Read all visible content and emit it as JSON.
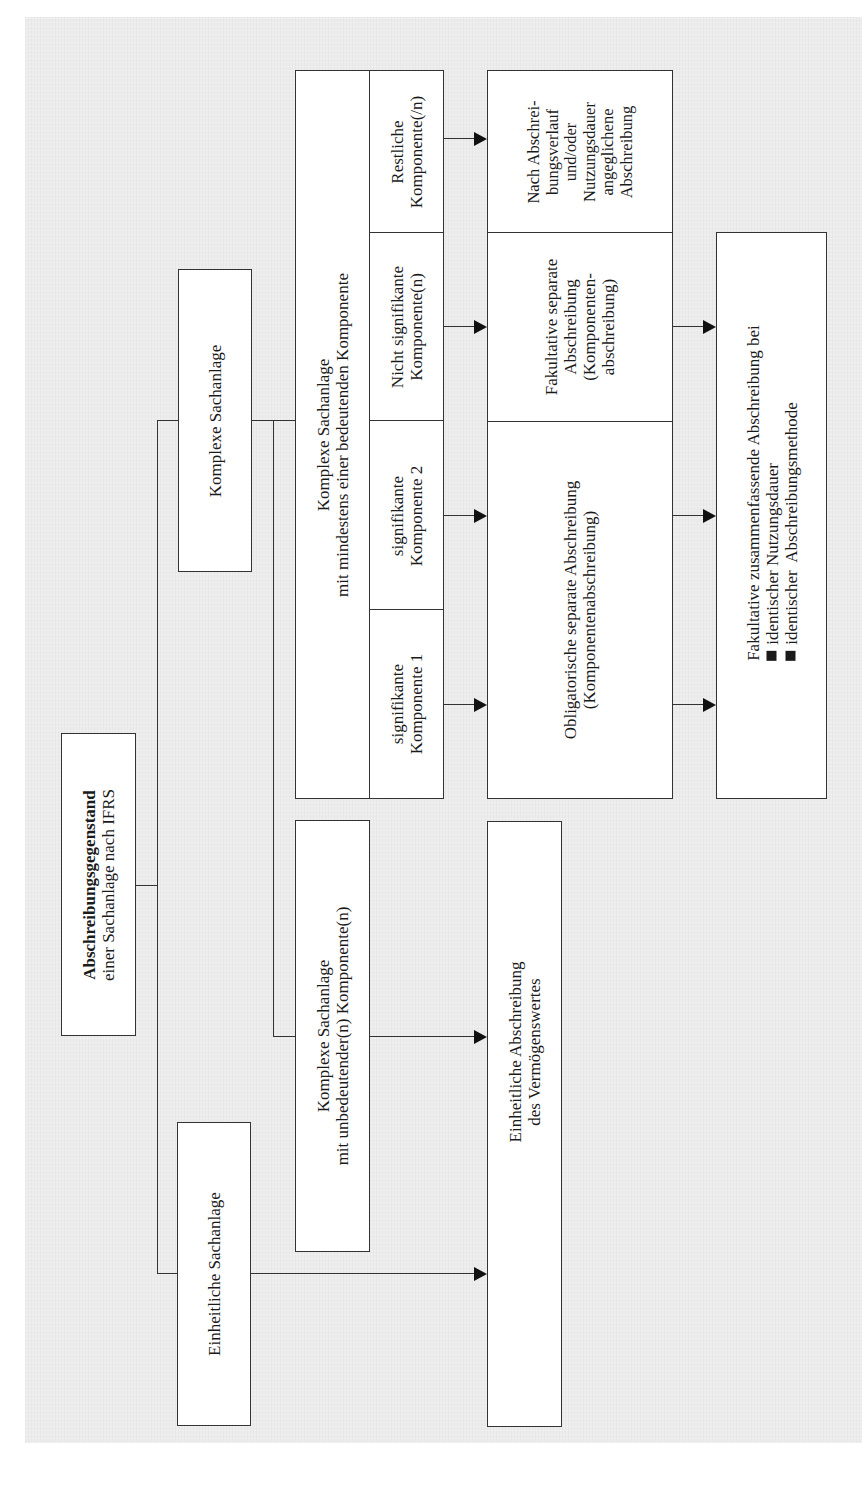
{
  "diagram": {
    "orientation": "rotated-90-ccw",
    "root": {
      "title_bold": "Abschreibungsgegenstand",
      "subtitle": "einer Sachanlage nach IFRS"
    },
    "categories": {
      "einheitliche": {
        "label": "Einheitliche Sachanlage"
      },
      "komplexe": {
        "label": "Komplexe Sachanlage"
      }
    },
    "komplexe_unbedeutend": {
      "line1": "Komplexe Sachanlage",
      "line2": "mit unbedeutender(n) Komponente(n)"
    },
    "komplexe_bedeutend": {
      "line1": "Komplexe Sachanlage",
      "line2": "mit mindestens einer bedeutenden Komponente",
      "components": [
        {
          "line1": "signifikante",
          "line2": "Komponente 1"
        },
        {
          "line1": "signifikante",
          "line2": "Komponente 2"
        },
        {
          "line1": "Nicht signifikante",
          "line2": "Komponente(n)"
        },
        {
          "line1": "Restliche",
          "line2": "Komponente(/n)"
        }
      ]
    },
    "treatments": {
      "einheitlich": {
        "line1": "Einheitliche Abschreibung",
        "line2": "des Vermögenswertes"
      },
      "obligatorisch": {
        "line1": "Obligatorische separate Abschreibung",
        "line2": "(Komponentenabschreibung)"
      },
      "fakultativ_separat": {
        "line1": "Fakultative separate",
        "line2": "Abschreibung",
        "line3": "(Komponenten-",
        "line4": "abschreibung)"
      },
      "angeglichen": {
        "line1": "Nach Abschrei-",
        "line2": "bungsverlauf",
        "line3": "und/oder",
        "line4": "Nutzungsdauer",
        "line5": "angeglichene",
        "line6": "Abschreibung"
      }
    },
    "zusammenfassend": {
      "heading": "Fakultative zusammenfassende Abschreibung bei",
      "bullets": [
        "identischer Nutzungsdauer",
        "identischer  Abschreibungsmethode"
      ]
    },
    "colors": {
      "background": "#ececec",
      "box_fill": "#ffffff",
      "line": "#333333"
    }
  }
}
